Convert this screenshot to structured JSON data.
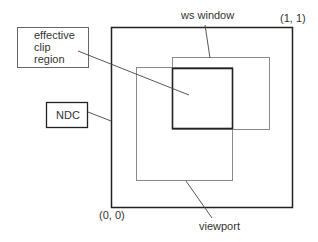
{
  "diagram": {
    "labels": {
      "effective_clip_line1": "effective",
      "effective_clip_line2": "clip",
      "effective_clip_line3": "region",
      "ndc": "NDC",
      "ws_window": "ws window",
      "viewport": "viewport",
      "corner_top_right": "(1, 1)",
      "corner_bottom_left": "(0, 0)"
    },
    "colors": {
      "ndc_border": "#222222",
      "clip_border": "#222222",
      "window_border": "#8a8a8a",
      "viewport_border": "#8a8a8a",
      "label_box_border": "#555555",
      "leader_line": "#444444"
    }
  }
}
